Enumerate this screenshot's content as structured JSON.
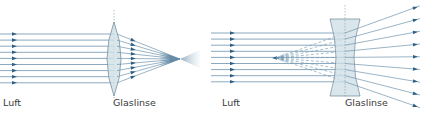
{
  "diagrams": [
    {
      "id": "converging",
      "lens_type": "convex",
      "medium_label": "Luft",
      "lens_label": "Glaslinse",
      "ray_count": 9,
      "behaviour": "rays converge to a focal point behind the lens"
    },
    {
      "id": "diverging",
      "lens_type": "concave",
      "medium_label": "Luft",
      "lens_label": "Glaslinse",
      "ray_count": 9,
      "behaviour": "rays diverge; dashed extensions meet at a virtual focal point in front of the lens"
    }
  ],
  "colors": {
    "ray": "#6f93ad",
    "arrow": "#2f5f84",
    "lens_fill": "#cfe0e6",
    "lens_stroke": "#6c8794",
    "axis": "#8a9aa3",
    "text": "#3a3a3a"
  }
}
